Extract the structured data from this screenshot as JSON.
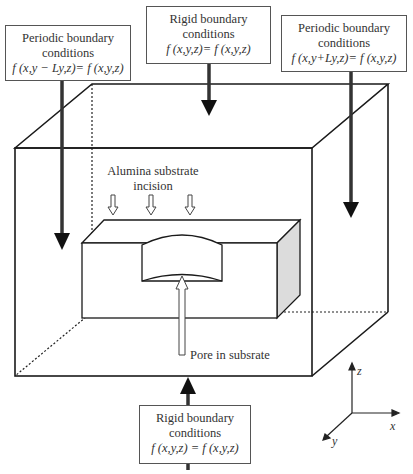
{
  "figure": {
    "top_left_box": {
      "line1": "Periodic boundary",
      "line2": "conditions",
      "equation": "f (x,y − Ly,z)= f (x,y,z)"
    },
    "top_center_box": {
      "line1": "Rigid boundary",
      "line2": "conditions",
      "equation": "f (x,y,z)= f (x,y,z)"
    },
    "top_right_box": {
      "line1": "Periodic boundary",
      "line2": "conditions",
      "equation": "f (x,y+Ly,z)= f (x,y,z)"
    },
    "bottom_box": {
      "line1": "Rigid boundary",
      "line2": "conditions",
      "equation": "f (x,y,z) = f (x,y,z)"
    },
    "incision_label": {
      "line1": "Alumina substrate",
      "line2": "incision"
    },
    "pore_label": "Pore in subsrate",
    "axes": {
      "z": "z",
      "x": "x",
      "y": "y"
    }
  },
  "colors": {
    "line": "#1a1a1a",
    "shaded_face": "#d9d9d9",
    "box_border": "#555555"
  }
}
